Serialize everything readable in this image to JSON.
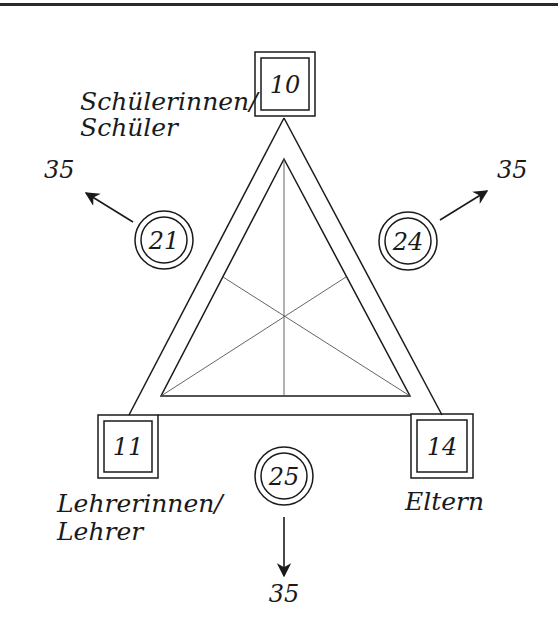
{
  "diagram": {
    "type": "triangle-relation-diagram",
    "colors": {
      "stroke": "#1a1a1a",
      "inner_lines": "#555555",
      "background": "#ffffff"
    },
    "vertices": {
      "top": {
        "label_line1": "Schülerinnen/",
        "label_line2": "Schüler",
        "value": "10"
      },
      "bottom_left": {
        "label_line1": "Lehrerinnen/",
        "label_line2": "Lehrer",
        "value": "11"
      },
      "bottom_right": {
        "label_line1": "Eltern",
        "value": "14"
      }
    },
    "edges": {
      "left": {
        "value": "21",
        "arrow_target": "35"
      },
      "right": {
        "value": "24",
        "arrow_target": "35"
      },
      "bottom": {
        "value": "25",
        "arrow_target": "35"
      }
    }
  }
}
